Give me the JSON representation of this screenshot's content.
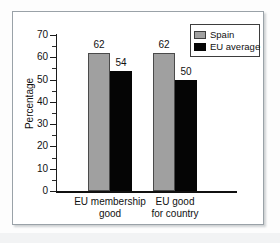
{
  "chart_data": {
    "type": "bar",
    "title": "",
    "subtitle": "",
    "xlabel": "",
    "ylabel": "Percentage",
    "ylim": [
      0,
      70
    ],
    "ytick_step": 10,
    "yminor_step": 5,
    "grid": false,
    "legend_position": "top-right",
    "categories": [
      "EU membership good",
      "EU good for country"
    ],
    "category_lines": [
      [
        "EU membership",
        "good"
      ],
      [
        "EU good",
        "for country"
      ]
    ],
    "series": [
      {
        "name": "Spain",
        "color": "#a0a0a0",
        "values": [
          62,
          62
        ]
      },
      {
        "name": "EU average",
        "color": "#050505",
        "values": [
          54,
          50
        ]
      }
    ],
    "yticks": [
      {
        "value": 70,
        "label": "70"
      },
      {
        "value": 60,
        "label": "60"
      },
      {
        "value": 50,
        "label": "50"
      },
      {
        "value": 40,
        "label": "40"
      },
      {
        "value": 30,
        "label": "30"
      },
      {
        "value": 20,
        "label": "20"
      },
      {
        "value": 10,
        "label": "10"
      },
      {
        "value": 0,
        "label": "0"
      }
    ],
    "yminor_ticks": [
      65,
      55,
      45,
      35,
      25,
      15,
      5
    ],
    "bar_labels": [
      "62",
      "54",
      "62",
      "50"
    ]
  },
  "legend": {
    "items": [
      {
        "label": "Spain",
        "swatch": "gray-swatch"
      },
      {
        "label": "EU average",
        "swatch": "black-swatch"
      }
    ]
  },
  "axis": {
    "y_title": "Percentage"
  }
}
